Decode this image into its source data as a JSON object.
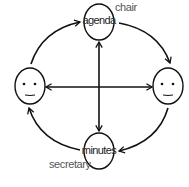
{
  "diagram": {
    "type": "meeting-roles-cycle",
    "nodes": [
      {
        "id": "agenda",
        "label": "agenda",
        "role": "chair",
        "position": "top"
      },
      {
        "id": "right-person",
        "label": "",
        "icon": "smiley-face",
        "position": "right"
      },
      {
        "id": "minutes",
        "label": "minutes",
        "role": "secretary",
        "position": "bottom"
      },
      {
        "id": "left-person",
        "label": "",
        "icon": "smiley-face",
        "position": "left"
      }
    ],
    "edges": [
      {
        "from": "left-person",
        "to": "agenda",
        "style": "curved-arrow"
      },
      {
        "from": "agenda",
        "to": "right-person",
        "style": "curved-arrow"
      },
      {
        "from": "right-person",
        "to": "minutes",
        "style": "curved-arrow"
      },
      {
        "from": "minutes",
        "to": "left-person",
        "style": "curved-arrow"
      },
      {
        "from": "agenda",
        "to": "minutes",
        "style": "double-arrow"
      },
      {
        "from": "left-person",
        "to": "right-person",
        "style": "double-arrow"
      }
    ],
    "labels": {
      "agenda": "agenda",
      "minutes": "minutes",
      "chair": "chair",
      "secretary": "secretary"
    },
    "colors": {
      "stroke": "#111111",
      "text": "#222222",
      "role_text": "#555555"
    }
  }
}
